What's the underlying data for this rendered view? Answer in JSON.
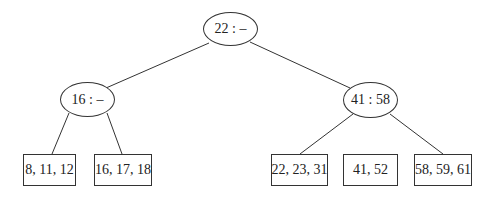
{
  "diagram": {
    "type": "tree",
    "root": {
      "label": "22 : –"
    },
    "internal": [
      {
        "label": "16 : –"
      },
      {
        "label": "41 : 58"
      }
    ],
    "leaves": [
      {
        "label": "8, 11, 12"
      },
      {
        "label": "16, 17, 18"
      },
      {
        "label": "22, 23, 31"
      },
      {
        "label": "41, 52"
      },
      {
        "label": "58, 59, 61"
      }
    ],
    "colors": {
      "line": "#333333",
      "background": "#ffffff",
      "text": "#222222"
    }
  }
}
